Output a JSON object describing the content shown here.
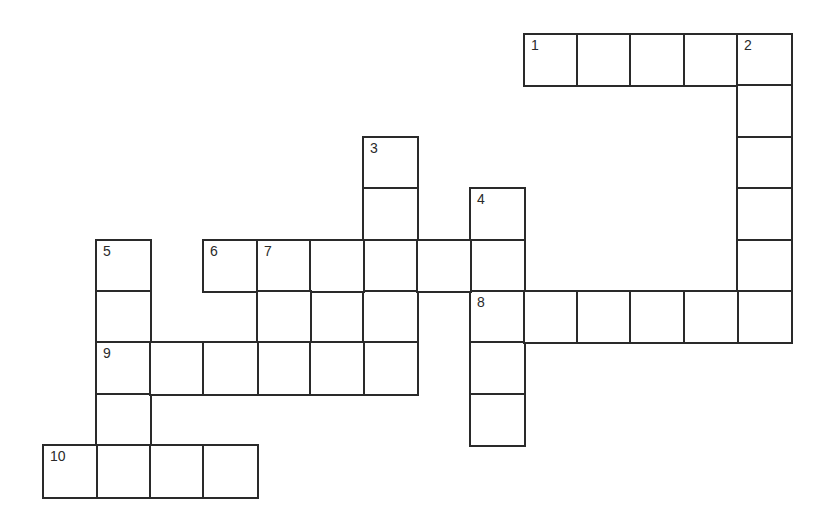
{
  "puzzle": {
    "type": "crossword",
    "grid_origin": {
      "x": 43,
      "y": 34
    },
    "cell_size": {
      "w": 53.4,
      "h": 51.4
    },
    "line_color": "#2a2a2a",
    "background_color": "#ffffff",
    "entries": [
      {
        "number": 1,
        "direction": "across",
        "row": 0,
        "col": 9,
        "length": 5
      },
      {
        "number": 2,
        "direction": "down",
        "row": 0,
        "col": 13,
        "length": 6
      },
      {
        "number": 3,
        "direction": "down",
        "row": 2,
        "col": 6,
        "length": 5
      },
      {
        "number": 4,
        "direction": "down",
        "row": 3,
        "col": 8,
        "length": 5
      },
      {
        "number": 5,
        "direction": "down",
        "row": 4,
        "col": 1,
        "length": 5
      },
      {
        "number": 6,
        "direction": "across",
        "row": 4,
        "col": 3,
        "length": 6
      },
      {
        "number": 7,
        "direction": "down",
        "row": 4,
        "col": 4,
        "length": 3
      },
      {
        "number": 8,
        "direction": "across",
        "row": 5,
        "col": 8,
        "length": 6
      },
      {
        "number": 9,
        "direction": "across",
        "row": 6,
        "col": 1,
        "length": 6
      },
      {
        "number": 10,
        "direction": "across",
        "row": 8,
        "col": 0,
        "length": 4
      }
    ],
    "letters": {}
  }
}
